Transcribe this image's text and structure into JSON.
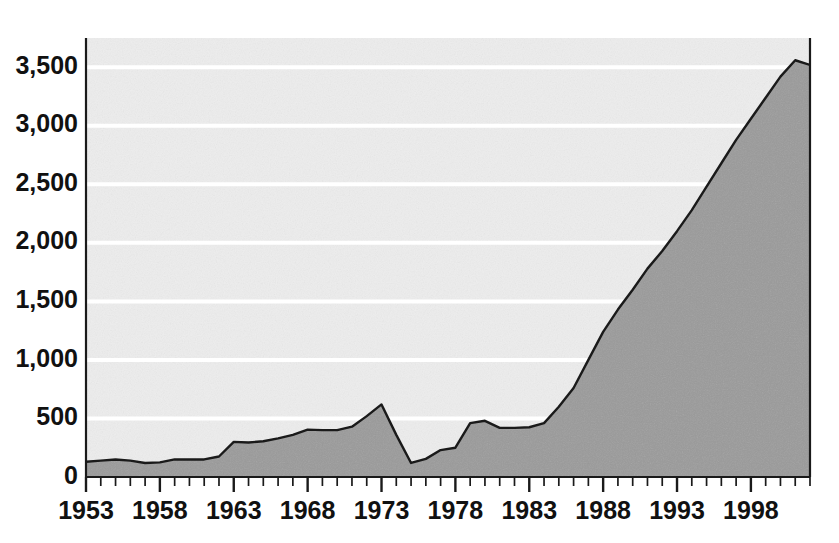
{
  "chart_data": {
    "type": "area",
    "title": "",
    "subtitle": "",
    "xlabel": "",
    "ylabel": "",
    "xlim": [
      1953,
      2002
    ],
    "ylim": [
      0,
      3750
    ],
    "grid": true,
    "gridlines_y": [
      500,
      1000,
      1500,
      2000,
      2500,
      3000,
      3500
    ],
    "legend": "none",
    "y_ticks": [
      {
        "value": 0,
        "label": "0"
      },
      {
        "value": 500,
        "label": "500"
      },
      {
        "value": 1000,
        "label": "1,000"
      },
      {
        "value": 1500,
        "label": "1,500"
      },
      {
        "value": 2000,
        "label": "2,000"
      },
      {
        "value": 2500,
        "label": "2,500"
      },
      {
        "value": 3000,
        "label": "3,000"
      },
      {
        "value": 3500,
        "label": "3,500"
      }
    ],
    "x_ticks_major": [
      {
        "value": 1953,
        "label": "1953"
      },
      {
        "value": 1958,
        "label": "1958"
      },
      {
        "value": 1963,
        "label": "1963"
      },
      {
        "value": 1968,
        "label": "1968"
      },
      {
        "value": 1973,
        "label": "1973"
      },
      {
        "value": 1978,
        "label": "1978"
      },
      {
        "value": 1983,
        "label": "1983"
      },
      {
        "value": 1988,
        "label": "1988"
      },
      {
        "value": 1993,
        "label": "1993"
      },
      {
        "value": 1998,
        "label": "1998"
      }
    ],
    "x_minor_tick_interval": 1,
    "colors": {
      "area_fill": "#9a9a9a",
      "plot_background": "#ededed",
      "gridline": "#ffffff",
      "line_stroke": "#1a1a1a",
      "axis": "#1a1a1a",
      "tick": "#1a1a1a",
      "text": "#111111",
      "page_background": "#ffffff"
    },
    "x": [
      1953,
      1954,
      1955,
      1956,
      1957,
      1958,
      1959,
      1960,
      1961,
      1962,
      1963,
      1964,
      1965,
      1966,
      1967,
      1968,
      1969,
      1970,
      1971,
      1972,
      1973,
      1974,
      1975,
      1976,
      1977,
      1978,
      1979,
      1980,
      1981,
      1982,
      1983,
      1984,
      1985,
      1986,
      1987,
      1988,
      1989,
      1990,
      1991,
      1992,
      1993,
      1994,
      1995,
      1996,
      1997,
      1998,
      1999,
      2000,
      2001,
      2002
    ],
    "values": [
      130,
      140,
      150,
      140,
      120,
      125,
      150,
      150,
      150,
      175,
      300,
      295,
      305,
      330,
      360,
      405,
      400,
      400,
      430,
      520,
      620,
      360,
      120,
      155,
      230,
      250,
      460,
      480,
      420,
      420,
      425,
      460,
      600,
      760,
      1000,
      1240,
      1430,
      1600,
      1780,
      1930,
      2100,
      2280,
      2480,
      2680,
      2880,
      3060,
      3240,
      3420,
      3560,
      3520
    ]
  }
}
